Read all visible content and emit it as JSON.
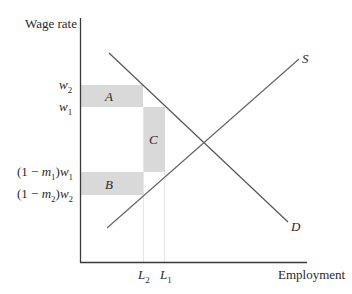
{
  "diagram": {
    "y_axis_label": "Wage rate",
    "x_axis_label": "Employment",
    "curves": {
      "supply": {
        "label": "S"
      },
      "demand": {
        "label": "D"
      }
    },
    "y_ticks": {
      "w2": {
        "base": "w",
        "sub": "2"
      },
      "w1": {
        "base": "w",
        "sub": "1"
      },
      "net_w1": {
        "prefix": "(1 − ",
        "m": "m",
        "msub": "1",
        "mid": ")",
        "w": "w",
        "wsub": "1"
      },
      "net_w2": {
        "prefix": "(1 − ",
        "m": "m",
        "msub": "2",
        "mid": ")",
        "w": "w",
        "wsub": "2"
      }
    },
    "x_ticks": {
      "L2": {
        "base": "L",
        "sub": "2"
      },
      "L1": {
        "base": "L",
        "sub": "1"
      }
    },
    "regions": {
      "A": "A",
      "B": "B",
      "C": "C"
    },
    "colors": {
      "axis": "#3a3a3a",
      "curve": "#555555",
      "shade": "#d9d9d9",
      "guide": "#e6e6e6"
    }
  }
}
